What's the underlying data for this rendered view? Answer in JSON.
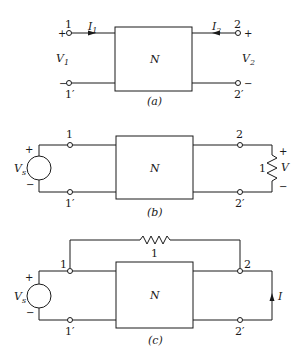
{
  "figure": {
    "panels": [
      {
        "id": "a",
        "caption": "(a)",
        "network_label": "N",
        "terminals": {
          "left_top": "1",
          "left_bottom": "1′",
          "right_top": "2",
          "right_bottom": "2′"
        },
        "currents": {
          "left": "I",
          "left_sub": "1",
          "right": "I",
          "right_sub": "2"
        },
        "voltages": {
          "left": "V",
          "left_sub": "1",
          "right": "V",
          "right_sub": "2"
        },
        "signs": {
          "plus": "+",
          "minus": "−"
        }
      },
      {
        "id": "b",
        "caption": "(b)",
        "network_label": "N",
        "terminals": {
          "left_top": "1",
          "left_bottom": "1′",
          "right_top": "2",
          "right_bottom": "2′"
        },
        "source": {
          "label": "V",
          "label_sub": "s",
          "plus": "+",
          "minus": "−"
        },
        "load": {
          "value": "1",
          "voltage": "V",
          "plus": "+",
          "minus": "−"
        }
      },
      {
        "id": "c",
        "caption": "(c)",
        "network_label": "N",
        "terminals": {
          "left_top": "1",
          "left_bottom": "1′",
          "right_top": "2",
          "right_bottom": "2′"
        },
        "source": {
          "label": "V",
          "label_sub": "s",
          "plus": "+",
          "minus": "−"
        },
        "bridge_resistor": {
          "value": "1"
        },
        "current": {
          "label": "I"
        }
      }
    ]
  }
}
